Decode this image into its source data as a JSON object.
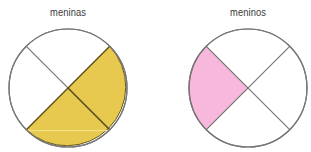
{
  "diagrams": [
    {
      "label": "meninas",
      "cx": 68,
      "cy": 88,
      "r": 59,
      "parts": 4,
      "shaded": [
        "right",
        "bottom"
      ],
      "fill": "#e6c94e"
    },
    {
      "label": "meninos",
      "cx": 248,
      "cy": 88,
      "r": 59,
      "parts": 4,
      "shaded": [
        "left"
      ],
      "fill": "#f7b8dc"
    }
  ],
  "colors": {
    "outline": "#777777",
    "shaded_outline": "#6b5a1e",
    "background": "#ffffff"
  }
}
